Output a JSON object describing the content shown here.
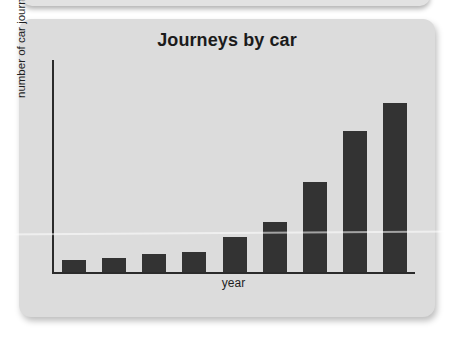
{
  "card": {
    "background_color": "#dcdcdc",
    "page_background_color": "#ffffff"
  },
  "chart_data": {
    "type": "bar",
    "title": "Journeys by car",
    "subtitle": "",
    "xlabel": "year",
    "ylabel": "number of car journeys",
    "categories": [
      "",
      "",
      "",
      "",
      "",
      "",
      "",
      "",
      ""
    ],
    "values": [
      12,
      14,
      18,
      20,
      35,
      50,
      90,
      141,
      169
    ],
    "series": [
      {
        "name": "number of car journeys",
        "values": [
          12,
          14,
          18,
          20,
          35,
          50,
          90,
          141,
          169
        ]
      }
    ],
    "ylim": [
      0,
      212
    ],
    "xlim": [
      0,
      9
    ],
    "grid": false,
    "legend": false,
    "legend_position": "none",
    "tick_labels_x": [],
    "tick_labels_y": [],
    "annotations": [],
    "bar_color": "#333333",
    "axis_color": "#2b2b2b"
  },
  "icons": {
    "card_shadow": "drop-shadow"
  }
}
